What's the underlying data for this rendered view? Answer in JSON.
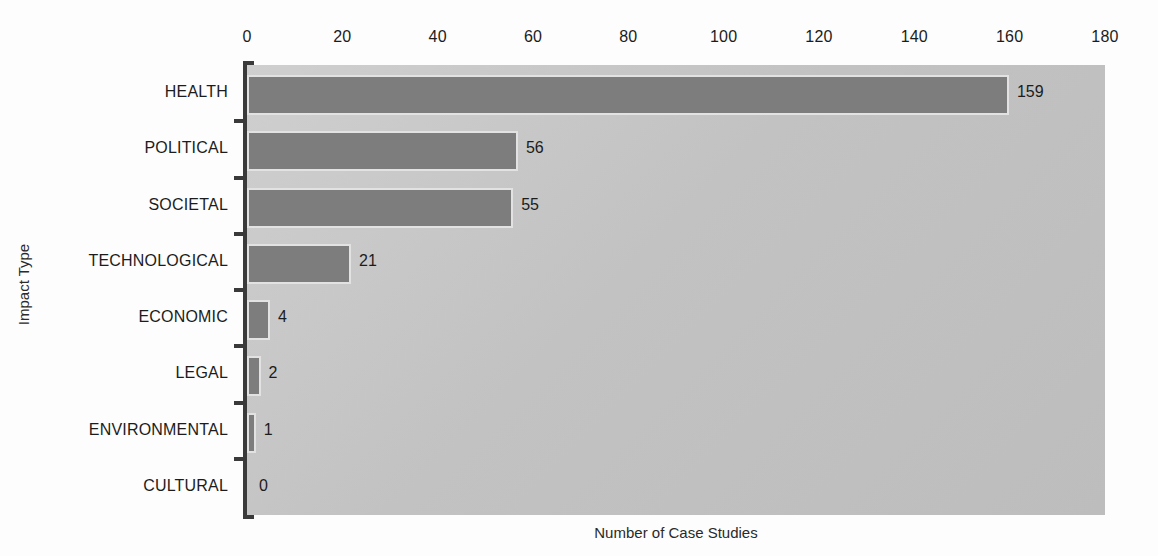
{
  "chart_data": {
    "type": "bar",
    "orientation": "horizontal",
    "title": "",
    "xlabel": "Number of Case Studies",
    "ylabel": "Impact Type",
    "categories": [
      "HEALTH",
      "POLITICAL",
      "SOCIETAL",
      "TECHNOLOGICAL",
      "ECONOMIC",
      "LEGAL",
      "ENVIRONMENTAL",
      "CULTURAL"
    ],
    "values": [
      159,
      56,
      55,
      21,
      4,
      2,
      1,
      0
    ],
    "value_labels": [
      "159",
      "56",
      "55",
      "21",
      "4",
      "2",
      "1",
      "0"
    ],
    "xlim": [
      0,
      180
    ],
    "xticks": [
      0,
      20,
      40,
      60,
      80,
      100,
      120,
      140,
      160,
      180
    ],
    "xtick_labels": [
      "0",
      "20",
      "40",
      "60",
      "80",
      "100",
      "120",
      "140",
      "160",
      "180"
    ],
    "grid": false,
    "legend": "none",
    "bar_color": "#7d7d7d",
    "bar_edge_color": "#e2e2e2",
    "plot_background": "#c3c3c3",
    "figure_background": "#fdfdfd",
    "axis_color": "#3a3a3a",
    "text_color": "#1c1c1c"
  }
}
